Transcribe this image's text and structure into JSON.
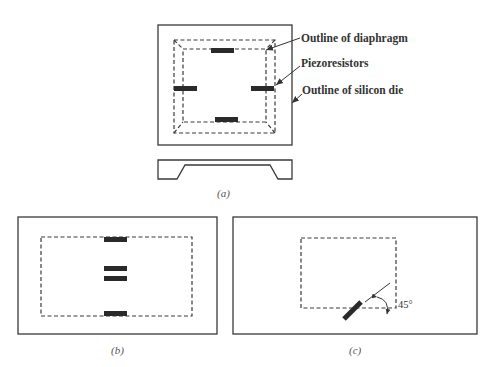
{
  "figure": {
    "panel_a": {
      "caption": "(a)",
      "labels": {
        "diaphragm": "Outline of diaphragm",
        "piezoresistors": "Piezoresistors",
        "die": "Outline of silicon die"
      }
    },
    "panel_b": {
      "caption": "(b)"
    },
    "panel_c": {
      "caption": "(c)",
      "angle_label": "45°"
    }
  },
  "colors": {
    "line": "#3a3a3a",
    "resistor": "#2a2a2a",
    "background": "#ffffff"
  }
}
